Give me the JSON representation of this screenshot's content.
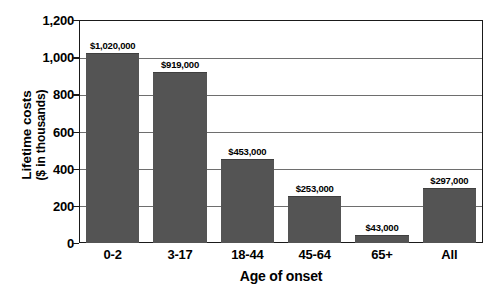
{
  "chart_data": {
    "type": "bar",
    "title": "",
    "subtitle": "",
    "xlabel": "Age of onset",
    "ylabel_line1": "Lifetime costs",
    "ylabel_line2": "($ in thousands)",
    "categories": [
      "0-2",
      "3-17",
      "18-44",
      "45-64",
      "65+",
      "All"
    ],
    "values": [
      1020,
      919,
      453,
      253,
      43,
      297
    ],
    "data_labels": [
      "$1,020,000",
      "$919,000",
      "$453,000",
      "$253,000",
      "$43,000",
      "$297,000"
    ],
    "ylim": [
      0,
      1200
    ],
    "ytick_values": [
      0,
      200,
      400,
      600,
      800,
      1000,
      1200
    ],
    "ytick_labels": [
      "0",
      "200",
      "400",
      "600",
      "800",
      "1,000",
      "1,200"
    ],
    "grid": true,
    "grid_axis": "y",
    "legend": false,
    "legend_position": "none",
    "bar_color": "#545454",
    "axis_color": "#1a1a1a",
    "gridline_color": "#6e6e6e",
    "background_color": "#ffffff"
  }
}
